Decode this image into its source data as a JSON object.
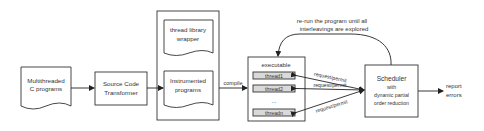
{
  "nodes": {
    "source_doc": {
      "line1": "Multithreaded",
      "line2": "C programs"
    },
    "transformer": {
      "line1": "Source Code",
      "line2": "Transformer"
    },
    "wrapper_doc": {
      "line1": "thread library",
      "line2": "wrapper"
    },
    "instrumented_doc": {
      "line1": "Instrumented",
      "line2": "programs"
    },
    "executable": {
      "title": "executable",
      "threads": [
        "thread1",
        "thread2",
        "...",
        "threadn"
      ]
    },
    "scheduler": {
      "line1": "Scheduler",
      "line2": "with",
      "line3": "dynamic partial",
      "line4": "order reduction"
    },
    "output": {
      "line1": "report",
      "line2": "errors"
    }
  },
  "edges": {
    "compile": "compile",
    "req1": "request/permit",
    "req2": "request/permit",
    "req3": "request/permit",
    "loop_line1": "re-run the program until all",
    "loop_line2": "interleavings are explored"
  },
  "colors": {
    "stroke": "#333333",
    "thread_fill": "#d9d9d9",
    "background": "#ffffff"
  }
}
